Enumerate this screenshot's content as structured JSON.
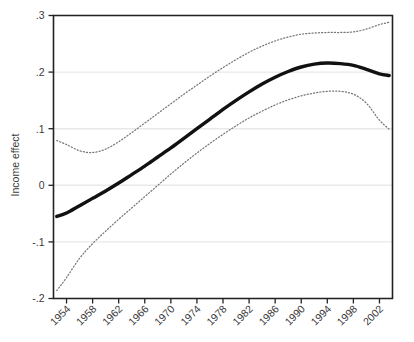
{
  "chart_data": {
    "type": "line",
    "title": "",
    "subtitle": "",
    "xlabel": "",
    "ylabel": "Income effect",
    "xlim": [
      1952,
      2004
    ],
    "ylim": [
      -0.2,
      0.3
    ],
    "grid": "horizontal",
    "legend": "none",
    "x_tick_labels": [
      "1954",
      "1958",
      "1962",
      "1966",
      "1970",
      "1974",
      "1978",
      "1982",
      "1986",
      "1990",
      "1994",
      "1998",
      "2002"
    ],
    "y_tick_labels": [
      ".3",
      ".2",
      ".1",
      "0",
      "-.1",
      "-.2"
    ],
    "y_tick_values": [
      0.3,
      0.2,
      0.1,
      0,
      -0.1,
      -0.2
    ],
    "x_tick_values": [
      1954,
      1958,
      1962,
      1966,
      1970,
      1974,
      1978,
      1982,
      1986,
      1990,
      1994,
      1998,
      2002
    ],
    "x": [
      1952.5,
      1954,
      1956,
      1958,
      1960,
      1962,
      1964,
      1966,
      1968,
      1970,
      1972,
      1974,
      1976,
      1978,
      1980,
      1982,
      1984,
      1986,
      1988,
      1990,
      1992,
      1994,
      1996,
      1998,
      2000,
      2002,
      2003.5
    ],
    "series": [
      {
        "name": "Income effect (fitted)",
        "style": "solid",
        "color": "#111111",
        "values": [
          -0.055,
          -0.049,
          -0.036,
          -0.023,
          -0.01,
          0.004,
          0.019,
          0.034,
          0.05,
          0.066,
          0.083,
          0.1,
          0.117,
          0.134,
          0.15,
          0.165,
          0.179,
          0.191,
          0.201,
          0.209,
          0.214,
          0.216,
          0.215,
          0.212,
          0.205,
          0.197,
          0.194
        ]
      },
      {
        "name": "Upper 95% confidence band",
        "style": "dotted",
        "color": "#777777",
        "values": [
          0.079,
          0.072,
          0.061,
          0.058,
          0.064,
          0.077,
          0.093,
          0.11,
          0.127,
          0.144,
          0.161,
          0.177,
          0.193,
          0.208,
          0.222,
          0.235,
          0.246,
          0.255,
          0.262,
          0.267,
          0.269,
          0.27,
          0.27,
          0.271,
          0.276,
          0.284,
          0.288
        ]
      },
      {
        "name": "Lower 95% confidence band",
        "style": "dotted",
        "color": "#777777",
        "values": [
          -0.186,
          -0.163,
          -0.129,
          -0.103,
          -0.081,
          -0.06,
          -0.04,
          -0.02,
          0.0,
          0.02,
          0.039,
          0.057,
          0.074,
          0.09,
          0.105,
          0.119,
          0.131,
          0.142,
          0.151,
          0.158,
          0.163,
          0.166,
          0.166,
          0.161,
          0.145,
          0.115,
          0.099
        ]
      }
    ]
  },
  "figure": {
    "background_color": "#ffffff",
    "grid_color": "#e9e9e9",
    "axis_color": "#222222",
    "text_color": "#3b3b3b"
  }
}
